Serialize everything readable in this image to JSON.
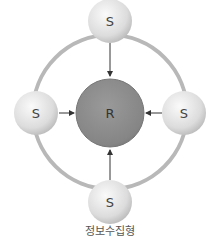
{
  "diagram": {
    "center_node": {
      "label": "R",
      "color": "#8a8a8a"
    },
    "satellite_nodes": [
      {
        "position": "top",
        "label": "S"
      },
      {
        "position": "left",
        "label": "S"
      },
      {
        "position": "right",
        "label": "S"
      },
      {
        "position": "bottom",
        "label": "S"
      }
    ],
    "edges": [
      {
        "from": "top-S",
        "to": "R"
      },
      {
        "from": "left-S",
        "to": "R"
      },
      {
        "from": "right-S",
        "to": "R"
      },
      {
        "from": "bottom-S",
        "to": "R"
      }
    ],
    "ring_color": "#b5b5b5",
    "caption": "정보수집형"
  }
}
